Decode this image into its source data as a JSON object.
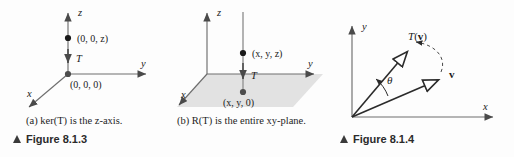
{
  "figure": {
    "panels": [
      {
        "id": "panel-a",
        "tag": "(a)",
        "caption": "(a)  ker(T) is the z-axis.",
        "figure_label": "Figure 8.1.3",
        "axes": [
          {
            "name": "z-axis",
            "label": "z"
          },
          {
            "name": "y-axis",
            "label": "y"
          },
          {
            "name": "x-axis",
            "label": "x"
          }
        ],
        "points": [
          {
            "name": "point-upper",
            "label": "(0, 0, z)"
          },
          {
            "name": "point-origin",
            "label": "(0, 0, 0)"
          }
        ],
        "map_arrow_label": "T"
      },
      {
        "id": "panel-b",
        "tag": "(b)",
        "caption": "(b) R(T) is the entire xy-plane.",
        "axes": [
          {
            "name": "z-axis",
            "label": "z"
          },
          {
            "name": "y-axis",
            "label": "y"
          },
          {
            "name": "x-axis",
            "label": "x"
          }
        ],
        "points": [
          {
            "name": "point-upper",
            "label": "(x, y, z)"
          },
          {
            "name": "point-projected",
            "label": "(x, y, 0)"
          }
        ],
        "map_arrow_label": "T",
        "shaded_region": "xy-plane"
      },
      {
        "id": "panel-c",
        "figure_label": "Figure 8.1.4",
        "axes": [
          {
            "name": "y-axis",
            "label": "y"
          },
          {
            "name": "x-axis",
            "label": "x"
          }
        ],
        "vectors": [
          {
            "name": "vector-v",
            "label": "v"
          },
          {
            "name": "vector-Tv",
            "label": "T(v)"
          }
        ],
        "angle_label": "θ",
        "arc": "rotation-arc"
      }
    ]
  },
  "colors": {
    "background": "#fdfdfd",
    "ink": "#1a1a1a",
    "axis": "#4a4a4a",
    "axis_light": "#8c8c8c",
    "plane_fill": "#e2e2e2",
    "marker_triangle": "#3a3a3a"
  }
}
